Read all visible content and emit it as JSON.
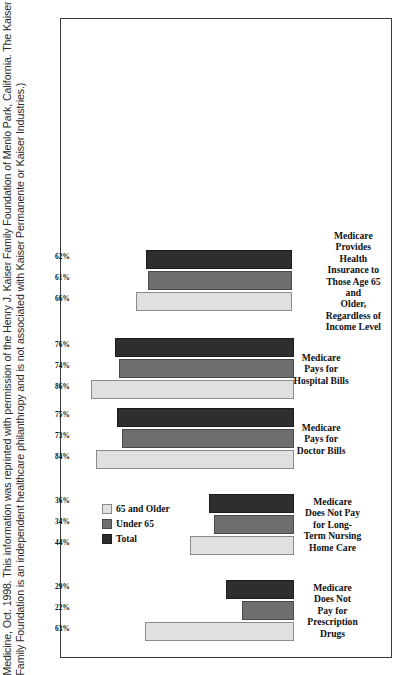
{
  "caption": {
    "text": "Medicine, Oct. 1998. This information was reprinted with permission of the Henry J. Kaiser Family Foundation of Menlo Park, California. The Kaiser Family Foundation is an independent healthcare philanthropy and is not associated with Kaiser Permanente or Kaiser Industries.)"
  },
  "colors": {
    "series_65_and_older": "#e0e0e0",
    "series_under_65": "#6e6e6e",
    "series_total": "#2e2e2e",
    "frame_border": "#3a3a3a",
    "background": "#ffffff"
  },
  "chart_data": {
    "type": "bar",
    "title": "",
    "subtitle": "",
    "xlabel": "",
    "ylabel": "",
    "ylim": [
      0,
      100
    ],
    "grid": false,
    "orientation": "horizontal",
    "legend_position": "upper-left",
    "value_suffix": "%",
    "categories": [
      "Medicare Does Not\nPay for Prescription\nDrugs",
      "Medicare Does Not Pay\nfor Long-Term Nursing\nHome Care",
      "Medicare Pays for\nDoctor Bills",
      "Medicare Pays for\nHospital Bills",
      "Medicare Provides Health\nInsurance to Those Age 65 and\nOlder, Regardless of Income Level"
    ],
    "series": [
      {
        "name": "65 and Older",
        "color": "#e0e0e0",
        "values": [
          63,
          44,
          84,
          86,
          66
        ],
        "labels": [
          "63%",
          "44%",
          "84%",
          "86%",
          "66%"
        ]
      },
      {
        "name": "Under 65",
        "color": "#6e6e6e",
        "values": [
          22,
          34,
          73,
          74,
          61
        ],
        "labels": [
          "22%",
          "34%",
          "73%",
          "74%",
          "61%"
        ]
      },
      {
        "name": "Total",
        "color": "#2e2e2e",
        "values": [
          29,
          36,
          75,
          76,
          62
        ],
        "labels": [
          "29%",
          "36%",
          "75%",
          "76%",
          "62%"
        ]
      }
    ]
  }
}
